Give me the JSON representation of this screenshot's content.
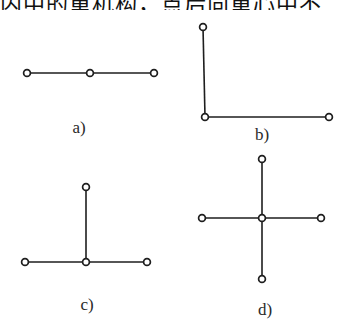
{
  "header": {
    "partial_text": "内中的重机构，点后向重心中不"
  },
  "figures": [
    {
      "id": "a",
      "label": "a)",
      "description": "three nodes in a horizontal line",
      "nodes": [
        [
          27,
          73
        ],
        [
          90,
          73
        ],
        [
          154,
          73
        ]
      ],
      "edges": [
        [
          0,
          1
        ],
        [
          1,
          2
        ]
      ],
      "label_pos": [
        79,
        133
      ]
    },
    {
      "id": "b",
      "label": "b)",
      "description": "L-shape: vertical edge down then horizontal edge right",
      "nodes": [
        [
          203,
          27
        ],
        [
          205,
          117
        ],
        [
          329,
          117
        ]
      ],
      "edges": [
        [
          0,
          1
        ],
        [
          1,
          2
        ]
      ],
      "label_pos": [
        262,
        140
      ]
    },
    {
      "id": "c",
      "label": "c)",
      "description": "T-shape: three horizontal nodes with a vertical branch up from center",
      "nodes": [
        [
          25,
          262
        ],
        [
          86,
          262
        ],
        [
          147,
          262
        ],
        [
          86,
          187
        ]
      ],
      "edges": [
        [
          0,
          1
        ],
        [
          1,
          2
        ],
        [
          1,
          3
        ]
      ],
      "label_pos": [
        87,
        310
      ]
    },
    {
      "id": "d",
      "label": "d)",
      "description": "cross: center node with four arms",
      "nodes": [
        [
          262,
          218
        ],
        [
          202,
          218
        ],
        [
          321,
          218
        ],
        [
          262,
          159
        ],
        [
          262,
          279
        ]
      ],
      "edges": [
        [
          0,
          1
        ],
        [
          0,
          2
        ],
        [
          0,
          3
        ],
        [
          0,
          4
        ]
      ],
      "label_pos": [
        265,
        315
      ]
    }
  ],
  "style": {
    "line_color": "#1e1e1e",
    "node_radius": 3.4
  }
}
